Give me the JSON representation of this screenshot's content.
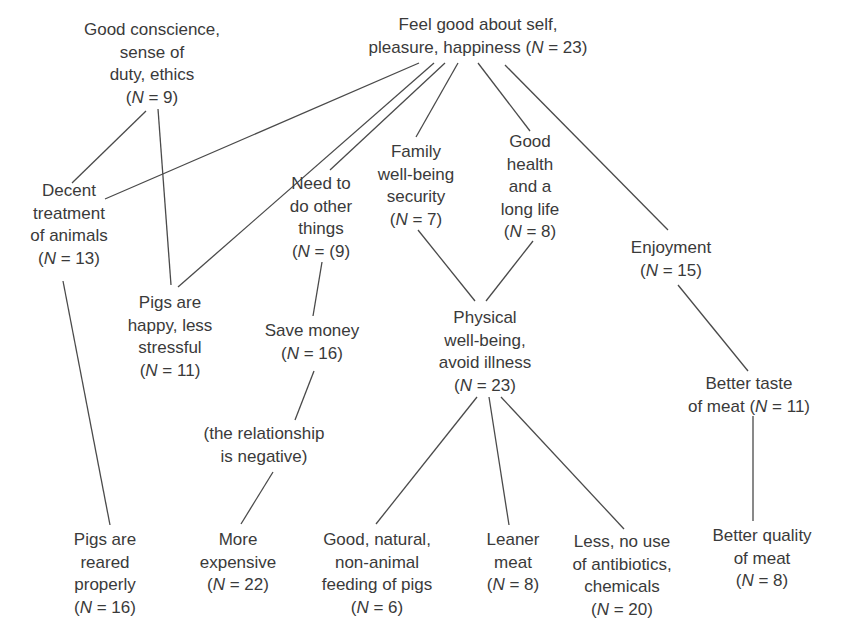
{
  "diagram": {
    "type": "means-end chain / hierarchical value map",
    "nodes": [
      {
        "id": "feel_good",
        "lines": [
          "Feel good about self,",
          "pleasure, happiness (N = 23)"
        ],
        "n": 23,
        "x": 478,
        "y": 14
      },
      {
        "id": "conscience",
        "lines": [
          "Good conscience,",
          "sense of",
          "duty, ethics",
          "(N = 9)"
        ],
        "n": 9,
        "x": 152,
        "y": 19
      },
      {
        "id": "decent",
        "lines": [
          "Decent",
          "treatment",
          "of animals",
          "(N = 13)"
        ],
        "n": 13,
        "x": 69,
        "y": 180
      },
      {
        "id": "pigs_happy",
        "lines": [
          "Pigs are",
          "happy, less",
          "stressful",
          "(N = 11)"
        ],
        "n": 11,
        "x": 170,
        "y": 292
      },
      {
        "id": "need_other",
        "lines": [
          "Need to",
          "do other",
          "things",
          "(N = (9)"
        ],
        "n": 9,
        "x": 321,
        "y": 173
      },
      {
        "id": "family",
        "lines": [
          "Family",
          "well-being",
          "security",
          "(N = 7)"
        ],
        "n": 7,
        "x": 416,
        "y": 141
      },
      {
        "id": "health",
        "lines": [
          "Good",
          "health",
          "and a",
          "long life",
          "(N = 8)"
        ],
        "n": 8,
        "x": 530,
        "y": 131
      },
      {
        "id": "enjoyment",
        "lines": [
          "Enjoyment",
          "(N = 15)"
        ],
        "n": 15,
        "x": 671,
        "y": 237
      },
      {
        "id": "save_money",
        "lines": [
          "Save money",
          "(N = 16)"
        ],
        "n": 16,
        "x": 312,
        "y": 320
      },
      {
        "id": "negative",
        "lines": [
          "(the relationship",
          "is negative)"
        ],
        "n": null,
        "x": 264,
        "y": 423
      },
      {
        "id": "physical",
        "lines": [
          "Physical",
          "well-being,",
          "avoid illness",
          "(N = 23)"
        ],
        "n": 23,
        "x": 485,
        "y": 307
      },
      {
        "id": "taste",
        "lines": [
          "Better taste",
          "of meat (N = 11)"
        ],
        "n": 11,
        "x": 749,
        "y": 373
      },
      {
        "id": "pigs_reared",
        "lines": [
          "Pigs are",
          "reared",
          "properly",
          "(N = 16)"
        ],
        "n": 16,
        "x": 105,
        "y": 529
      },
      {
        "id": "expensive",
        "lines": [
          "More",
          "expensive",
          "(N = 22)"
        ],
        "n": 22,
        "x": 238,
        "y": 529
      },
      {
        "id": "feeding",
        "lines": [
          "Good, natural,",
          "non-animal",
          "feeding of pigs",
          "(N = 6)"
        ],
        "n": 6,
        "x": 377,
        "y": 529
      },
      {
        "id": "leaner",
        "lines": [
          "Leaner",
          "meat",
          "(N = 8)"
        ],
        "n": 8,
        "x": 513,
        "y": 529
      },
      {
        "id": "antibiotics",
        "lines": [
          "Less, no use",
          "of antibiotics,",
          "chemicals",
          "(N = 20)"
        ],
        "n": 20,
        "x": 622,
        "y": 531
      },
      {
        "id": "quality",
        "lines": [
          "Better quality",
          "of meat",
          "(N = 8)"
        ],
        "n": 8,
        "x": 762,
        "y": 525
      }
    ],
    "edges": [
      {
        "from": "feel_good",
        "to": "decent",
        "x1": 419,
        "y1": 63,
        "x2": 105,
        "y2": 199
      },
      {
        "from": "feel_good",
        "to": "pigs_happy",
        "x1": 434,
        "y1": 63,
        "x2": 178,
        "y2": 287
      },
      {
        "from": "feel_good",
        "to": "need_other",
        "x1": 445,
        "y1": 63,
        "x2": 330,
        "y2": 170
      },
      {
        "from": "feel_good",
        "to": "family",
        "x1": 458,
        "y1": 63,
        "x2": 416,
        "y2": 137
      },
      {
        "from": "feel_good",
        "to": "health",
        "x1": 478,
        "y1": 63,
        "x2": 530,
        "y2": 131
      },
      {
        "from": "feel_good",
        "to": "enjoyment",
        "x1": 505,
        "y1": 65,
        "x2": 668,
        "y2": 230
      },
      {
        "from": "conscience",
        "to": "decent",
        "x1": 146,
        "y1": 111,
        "x2": 72,
        "y2": 183
      },
      {
        "from": "conscience",
        "to": "pigs_happy",
        "x1": 158,
        "y1": 109,
        "x2": 171,
        "y2": 285
      },
      {
        "from": "decent",
        "to": "pigs_reared",
        "x1": 63,
        "y1": 281,
        "x2": 110,
        "y2": 525
      },
      {
        "from": "need_other",
        "to": "save_money",
        "x1": 322,
        "y1": 262,
        "x2": 313,
        "y2": 316
      },
      {
        "from": "save_money",
        "to": "negative",
        "x1": 314,
        "y1": 371,
        "x2": 295,
        "y2": 420
      },
      {
        "from": "negative",
        "to": "expensive",
        "x1": 273,
        "y1": 472,
        "x2": 241,
        "y2": 524
      },
      {
        "from": "family",
        "to": "physical",
        "x1": 418,
        "y1": 230,
        "x2": 475,
        "y2": 301
      },
      {
        "from": "health",
        "to": "physical",
        "x1": 533,
        "y1": 241,
        "x2": 486,
        "y2": 301
      },
      {
        "from": "physical",
        "to": "feeding",
        "x1": 477,
        "y1": 397,
        "x2": 376,
        "y2": 524
      },
      {
        "from": "physical",
        "to": "leaner",
        "x1": 489,
        "y1": 397,
        "x2": 509,
        "y2": 525
      },
      {
        "from": "physical",
        "to": "antibiotics",
        "x1": 501,
        "y1": 397,
        "x2": 624,
        "y2": 529
      },
      {
        "from": "enjoyment",
        "to": "taste",
        "x1": 678,
        "y1": 285,
        "x2": 748,
        "y2": 371
      },
      {
        "from": "taste",
        "to": "quality",
        "x1": 753,
        "y1": 416,
        "x2": 753,
        "y2": 521
      }
    ]
  }
}
